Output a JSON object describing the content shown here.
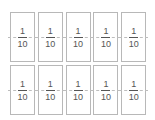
{
  "diagram": {
    "title": "",
    "rows": 2,
    "columns": 5,
    "cards": [
      {
        "numerator": "1",
        "denominator": "10"
      },
      {
        "numerator": "1",
        "denominator": "10"
      },
      {
        "numerator": "1",
        "denominator": "10"
      },
      {
        "numerator": "1",
        "denominator": "10"
      },
      {
        "numerator": "1",
        "denominator": "10"
      },
      {
        "numerator": "1",
        "denominator": "10"
      },
      {
        "numerator": "1",
        "denominator": "10"
      },
      {
        "numerator": "1",
        "denominator": "10"
      },
      {
        "numerator": "1",
        "denominator": "10"
      },
      {
        "numerator": "1",
        "denominator": "10"
      }
    ],
    "colors": {
      "border": "#b8b8b8",
      "text": "#555555",
      "dash": "#bdbdbd"
    }
  }
}
